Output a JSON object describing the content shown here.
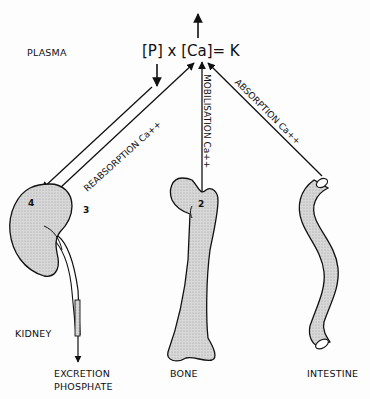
{
  "diagram": {
    "compartment_label": "PLASMA",
    "equation": "[P] x [Ca]= K",
    "organs": {
      "kidney": {
        "label": "KIDNEY"
      },
      "bone": {
        "label": "BONE"
      },
      "intestine": {
        "label": "INTESTINE"
      }
    },
    "flows": {
      "reabsorption": "REABSORPTION Ca++",
      "mobilisation": "MOBILISATION Ca++",
      "absorption": "ABSORPTION Ca++",
      "excretion_line1": "EXCRETION",
      "excretion_line2": "PHOSPHATE"
    },
    "markers": {
      "kidney_4": "4",
      "kidney_3": "3",
      "bone_2": "2"
    },
    "colors": {
      "ink": "#111111",
      "fill": "#cfcfcf"
    }
  }
}
